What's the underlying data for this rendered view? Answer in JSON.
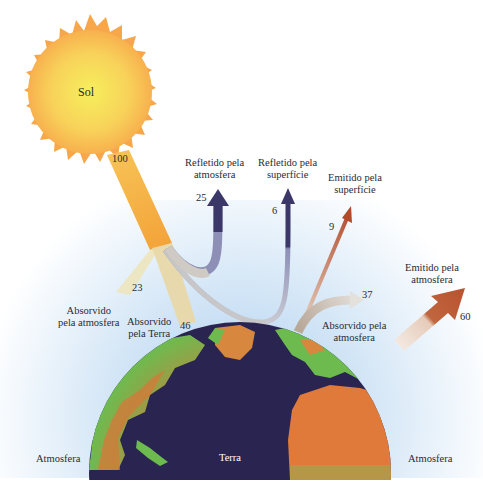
{
  "sun": {
    "label": "Sol",
    "value": "100"
  },
  "earth": {
    "label": "Terra"
  },
  "atmosphere": {
    "left_label": "Atmosfera",
    "right_label": "Atmosfera"
  },
  "flows": {
    "reflected_atmosphere": {
      "label_line1": "Refletido pela",
      "label_line2": "atmosfera",
      "value": "25"
    },
    "reflected_surface": {
      "label_line1": "Refletido pela",
      "label_line2": "superfície",
      "value": "6"
    },
    "emitted_surface": {
      "label_line1": "Emitido pela",
      "label_line2": "superfície",
      "value": "9"
    },
    "absorbed_atmosphere_solar": {
      "label_line1": "Absorvido",
      "label_line2": "pela atmosfera",
      "value": "23"
    },
    "absorbed_earth": {
      "label_line1": "Absorvido",
      "label_line2": "pela Terra",
      "value": "46"
    },
    "absorbed_atmosphere_surface": {
      "label_line1": "Absorvido pela",
      "label_line2": "atmosfera",
      "value": "37"
    },
    "emitted_atmosphere": {
      "label_line1": "Emitido pela",
      "label_line2": "atmosfera",
      "value": "60"
    }
  },
  "colors": {
    "sun_core": "#f7ec5a",
    "sun_edge": "#f7a64a",
    "beam": "#f5a53c",
    "reflected": "#3c3868",
    "emitted": "#b8522e",
    "ocean": "#2a2450",
    "land_green": "#6dbb4f",
    "land_orange": "#e07a3a",
    "atmosphere": "#cfe3f5"
  }
}
